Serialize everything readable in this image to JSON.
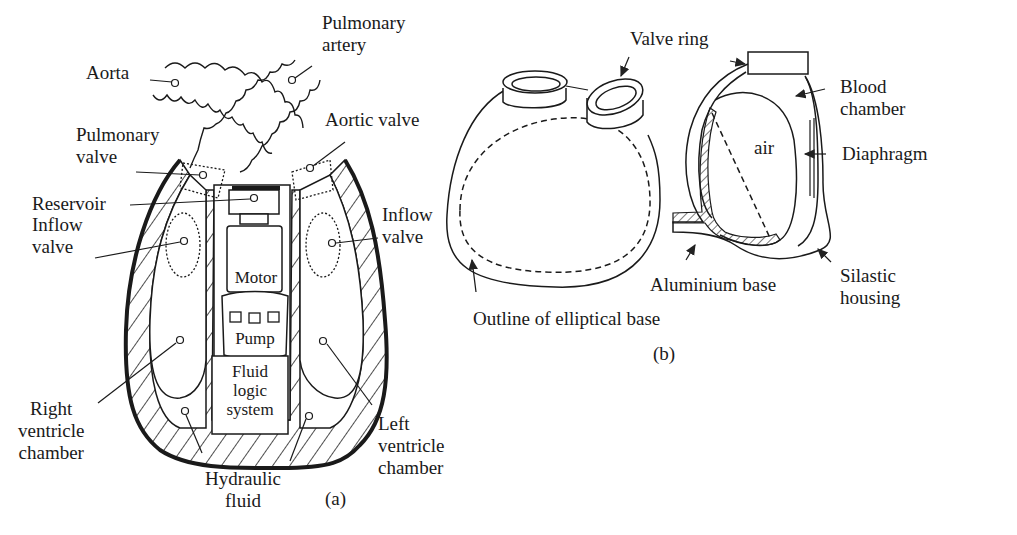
{
  "figure_a": {
    "caption": "(a)",
    "labels": {
      "aorta": "Aorta",
      "pulmonary_artery": "Pulmonary\nartery",
      "pulmonary_valve": "Pulmonary\nvalve",
      "aortic_valve": "Aortic valve",
      "reservoir": "Reservoir",
      "inflow_valve_left_side": "Inflow\nvalve",
      "inflow_valve_right_side": "Inflow\nvalve",
      "motor": "Motor",
      "pump": "Pump",
      "fluid_logic_system": "Fluid\nlogic\nsystem",
      "right_ventricle_chamber": "Right\nventricle\nchamber",
      "left_ventricle_chamber": "Left\nventricle\nchamber",
      "hydraulic_fluid": "Hydraulic\nfluid"
    }
  },
  "figure_b": {
    "caption": "(b)",
    "labels": {
      "valve_ring": "Valve ring",
      "blood_chamber": "Blood\nchamber",
      "air": "air",
      "diaphragm": "Diaphragm",
      "aluminium_base": "Aluminium base",
      "silastic_housing": "Silastic\nhousing",
      "outline_of_elliptical_base": "Outline of elliptical base"
    }
  }
}
